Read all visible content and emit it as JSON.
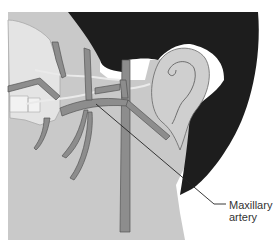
{
  "figure": {
    "colors": {
      "background": "#ffffff",
      "skin": "#c8c8c8",
      "hair": "#1c1c1c",
      "artery": "#8a8a8a",
      "artery_outline": "#555555",
      "nerve": "#e6e6e6",
      "bone_outline": "#9a9a9a",
      "leader_line": "#222222"
    },
    "labels": [
      {
        "id": "maxillary-artery",
        "line1": "Maxillary",
        "line2": "artery"
      }
    ]
  }
}
